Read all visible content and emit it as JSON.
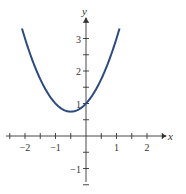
{
  "chart_data": {
    "type": "line",
    "title": "",
    "xlabel": "x",
    "ylabel": "y",
    "function": "y = x^2 + x + 1",
    "xlim": [
      -2.5,
      2.6
    ],
    "ylim": [
      -1.5,
      3.7
    ],
    "x_ticks": [
      -2,
      -1,
      1,
      2
    ],
    "y_ticks": [
      -1,
      1,
      2,
      3
    ],
    "minor_tick_step": 0.5,
    "grid": false,
    "series": [
      {
        "name": "parabola",
        "color": "#2b4a7e",
        "x": [
          -2.1,
          -2.0,
          -1.5,
          -1.0,
          -0.5,
          0.0,
          0.5,
          1.0,
          1.1
        ],
        "y": [
          3.31,
          3.0,
          1.75,
          1.0,
          0.75,
          1.0,
          1.75,
          3.0,
          3.31
        ]
      }
    ]
  },
  "labels": {
    "x_axis": "x",
    "y_axis": "y",
    "x_tick_labels": [
      "−2",
      "−1",
      "1",
      "2"
    ],
    "y_tick_labels": [
      "3",
      "2",
      "1",
      "−1"
    ]
  }
}
